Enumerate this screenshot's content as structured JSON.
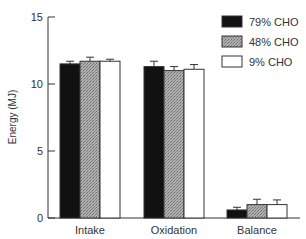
{
  "chart_data": {
    "type": "bar",
    "title": "",
    "xlabel": "",
    "ylabel": "Energy (MJ)",
    "ylim": [
      0,
      15
    ],
    "yticks": [
      0,
      5,
      10,
      15
    ],
    "grid": false,
    "legend_position": "top-right",
    "categories": [
      "Intake",
      "Oxidation",
      "Balance"
    ],
    "series": [
      {
        "name": "79% CHO",
        "color": "#111111",
        "pattern": "solid-black",
        "values": [
          11.5,
          11.3,
          0.6
        ],
        "errors": [
          0.2,
          0.4,
          0.2
        ]
      },
      {
        "name": "48% CHO",
        "color": "#9a9a9a",
        "pattern": "grey-stipple",
        "values": [
          11.7,
          11.0,
          1.0
        ],
        "errors": [
          0.3,
          0.3,
          0.4
        ]
      },
      {
        "name": "9% CHO",
        "color": "#ffffff",
        "pattern": "white",
        "values": [
          11.7,
          11.1,
          1.0
        ],
        "errors": [
          0.15,
          0.35,
          0.35
        ]
      }
    ]
  }
}
